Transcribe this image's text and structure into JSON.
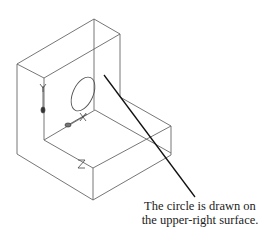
{
  "figure": {
    "type": "isometric wireframe of L-shaped solid with UCS icon",
    "caption": {
      "line1": "The circle is drawn on",
      "line2": "the upper-right surface."
    },
    "axis_labels": {
      "x": "X",
      "y": "Y",
      "z": "Z"
    },
    "colors": {
      "edges": "#555555",
      "leader": "#111111",
      "background": "#ffffff"
    }
  }
}
